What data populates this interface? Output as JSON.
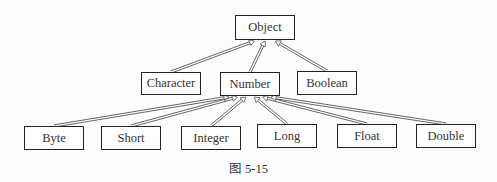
{
  "diagram": {
    "type": "class-hierarchy",
    "nodes": [
      {
        "id": "object",
        "label": "Object",
        "x": 235,
        "y": 15,
        "w": 60,
        "h": 25
      },
      {
        "id": "character",
        "label": "Character",
        "x": 141,
        "y": 72,
        "w": 60,
        "h": 23
      },
      {
        "id": "number",
        "label": "Number",
        "x": 220,
        "y": 72,
        "w": 60,
        "h": 24
      },
      {
        "id": "boolean",
        "label": "Boolean",
        "x": 297,
        "y": 71,
        "w": 60,
        "h": 24
      },
      {
        "id": "byte",
        "label": "Byte",
        "x": 24,
        "y": 126,
        "w": 60,
        "h": 24
      },
      {
        "id": "short",
        "label": "Short",
        "x": 101,
        "y": 126,
        "w": 60,
        "h": 24
      },
      {
        "id": "integer",
        "label": "Integer",
        "x": 181,
        "y": 126,
        "w": 60,
        "h": 24
      },
      {
        "id": "long",
        "label": "Long",
        "x": 257,
        "y": 124,
        "w": 60,
        "h": 24
      },
      {
        "id": "float",
        "label": "Float",
        "x": 337,
        "y": 124,
        "w": 60,
        "h": 24
      },
      {
        "id": "double",
        "label": "Double",
        "x": 416,
        "y": 124,
        "w": 60,
        "h": 24
      }
    ],
    "edges": [
      {
        "from": "character",
        "to": "object"
      },
      {
        "from": "number",
        "to": "object"
      },
      {
        "from": "boolean",
        "to": "object"
      },
      {
        "from": "byte",
        "to": "number"
      },
      {
        "from": "short",
        "to": "number"
      },
      {
        "from": "integer",
        "to": "number"
      },
      {
        "from": "long",
        "to": "number"
      },
      {
        "from": "float",
        "to": "number"
      },
      {
        "from": "double",
        "to": "number"
      }
    ],
    "caption": "图 5-15",
    "colors": {
      "line": "#555555",
      "border": "#222222",
      "text": "#333333"
    }
  }
}
